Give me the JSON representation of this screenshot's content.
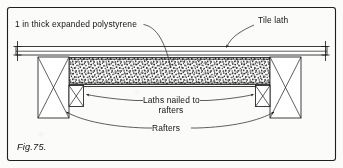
{
  "figure": {
    "caption": "Fig.75.",
    "border_color": "#1f1f1f",
    "ink_color": "#1b1b1b",
    "paper_color": "#fbfbfa"
  },
  "labels": {
    "polystyrene": "1 in thick expanded polystyrene",
    "tile_lath": "Tile lath",
    "laths_line1": "Laths nailed to",
    "laths_line2": "rafters",
    "rafters": "Rafters"
  },
  "components": {
    "tile_lath_board": {
      "name": "Tile lath",
      "description": "thin horizontal board spanning full width"
    },
    "polystyrene_layer": {
      "name": "1 in thick expanded polystyrene",
      "description": "speckled infill panel between rafters"
    },
    "left_rafter": {
      "name": "Rafter",
      "hatch": "cross-section X"
    },
    "right_rafter": {
      "name": "Rafter",
      "hatch": "cross-section X"
    },
    "left_lath": {
      "name": "Lath nailed to rafter",
      "hatch": "cross-section X"
    },
    "right_lath": {
      "name": "Lath nailed to rafter",
      "hatch": "cross-section X"
    }
  },
  "dimension_ticks": {
    "left": "vertical extent tick",
    "right": "vertical extent tick"
  }
}
